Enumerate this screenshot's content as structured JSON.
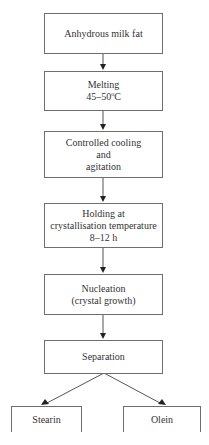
{
  "diagram": {
    "type": "process-flowchart",
    "colors": {
      "stroke": "#6e6e6e",
      "text": "#333333",
      "background": "#ffffff"
    },
    "steps": [
      {
        "id": "anhydrous-milk-fat",
        "lines": [
          "Anhydrous milk fat"
        ]
      },
      {
        "id": "melting",
        "lines": [
          "Melting",
          "45–50"
        ],
        "temperature_unit": "C",
        "degree_symbol": "o"
      },
      {
        "id": "controlled-cooling",
        "lines": [
          "Controlled cooling",
          "and",
          "agitation"
        ]
      },
      {
        "id": "holding",
        "lines": [
          "Holding at",
          "crystallisation temperature",
          "8–12 h"
        ]
      },
      {
        "id": "nucleation",
        "lines": [
          "Nucleation",
          "(crystal growth)"
        ]
      },
      {
        "id": "separation",
        "lines": [
          "Separation"
        ]
      }
    ],
    "outputs": [
      {
        "id": "stearin",
        "lines": [
          "Stearin"
        ]
      },
      {
        "id": "olein",
        "lines": [
          "Olein"
        ]
      }
    ],
    "edges": [
      {
        "from": "anhydrous-milk-fat",
        "to": "melting"
      },
      {
        "from": "melting",
        "to": "controlled-cooling"
      },
      {
        "from": "controlled-cooling",
        "to": "holding"
      },
      {
        "from": "holding",
        "to": "nucleation"
      },
      {
        "from": "nucleation",
        "to": "separation"
      },
      {
        "from": "separation",
        "to": "stearin"
      },
      {
        "from": "separation",
        "to": "olein"
      }
    ]
  }
}
